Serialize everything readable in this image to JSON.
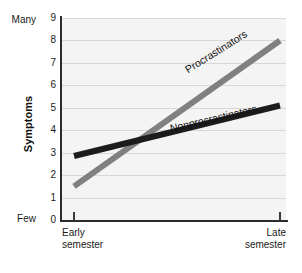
{
  "chart_data": {
    "type": "line",
    "title": "",
    "xlabel": "",
    "ylabel": "Symptoms",
    "ylim": [
      0,
      9
    ],
    "grid": true,
    "legend_position": "inline-on-lines",
    "categories": [
      "Early semester",
      "Late semester"
    ],
    "y_ticks": [
      "9",
      "8",
      "7",
      "6",
      "5",
      "4",
      "3",
      "2",
      "1",
      "0"
    ],
    "y_extreme_high": "Many",
    "y_extreme_low": "Few",
    "series": [
      {
        "name": "Procrastinators",
        "color": "#808080",
        "values": [
          1.5,
          8.0
        ]
      },
      {
        "name": "Nonprocrastinators",
        "color": "#1c1c1c",
        "values": [
          2.85,
          5.1
        ]
      }
    ],
    "x_tick_labels": [
      {
        "line1": "Early",
        "line2": "semester"
      },
      {
        "line1": "Late",
        "line2": "semester"
      }
    ],
    "colors": {
      "plot_background": "#f4f4f4",
      "gridline": "#d8d8d8",
      "axis": "#2b2b2b",
      "text": "#1a1a1a"
    }
  }
}
